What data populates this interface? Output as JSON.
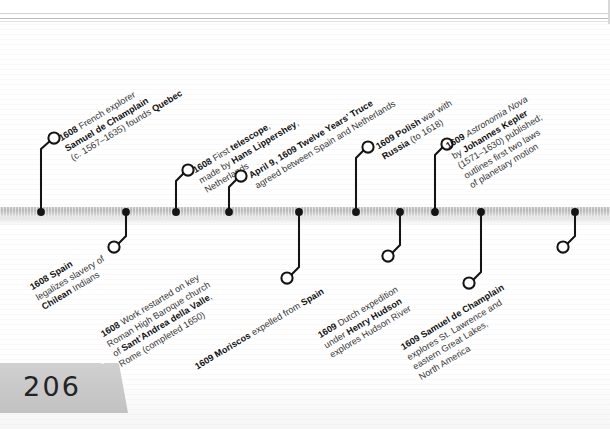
{
  "page": {
    "number": "206",
    "axis_color": "#b9b9b9",
    "ink_color": "#141414",
    "text_color": "#343434"
  },
  "timeline": {
    "orientation": "horizontal",
    "events_above": [
      {
        "id": "champlain-quebec",
        "marker_x": 41,
        "circle_x": 54,
        "circle_y": 138,
        "label_angle": -31,
        "label_x": 66,
        "label_y": 132,
        "lines": [
          "<b>1608</b> French explorer",
          "<b>Samuel de Champlain</b>",
          "(c. 1567–1635) founds <b>Quebec</b>"
        ]
      },
      {
        "id": "first-telescope",
        "marker_x": 176,
        "circle_x": 188,
        "circle_y": 170,
        "label_angle": -31,
        "label_x": 200,
        "label_y": 164,
        "lines": [
          "<b>1608</b> First <b>telescope</b>,",
          "made by <b>Hans Lippershey</b>,",
          "Netherlands"
        ]
      },
      {
        "id": "twelve-years-truce",
        "marker_x": 229,
        "circle_x": 241,
        "circle_y": 176,
        "label_angle": -31,
        "label_x": 253,
        "label_y": 170,
        "lines": [
          "<b>April 9, 1609 Twelve Years’ Truce</b>",
          "agreed between Spain and Netherlands"
        ]
      },
      {
        "id": "polish-russian-war",
        "marker_x": 356,
        "circle_x": 368,
        "circle_y": 147,
        "label_angle": -31,
        "label_x": 380,
        "label_y": 141,
        "lines": [
          "<b>1609 Polish</b> war with",
          "<b>Russia</b> (to 1618)"
        ]
      },
      {
        "id": "kepler-astronomia-nova",
        "marker_x": 435,
        "circle_x": 447,
        "circle_y": 144,
        "label_angle": -31,
        "label_x": 459,
        "label_y": 138,
        "lines": [
          "<b>1609</b> <i>Astronomia Nova</i>",
          "by <b>Johannes Kepler</b>",
          "(1571–1630) published;",
          "outlines first two laws",
          "of planetary motion"
        ]
      }
    ],
    "events_below": [
      {
        "id": "spain-slavery-chilean",
        "marker_x": 126,
        "circle_x": 114,
        "circle_y": 247,
        "label_angle": -31,
        "label_x": 37,
        "label_y": 281,
        "lines": [
          "<b>1608 Spain</b>",
          "legalizes slavery of",
          "<b>Chilean</b> Indians"
        ]
      },
      {
        "id": "santandrea-della-valle",
        "marker_x": 299,
        "circle_x": 287,
        "circle_y": 278,
        "label_angle": -31,
        "label_x": 111,
        "label_y": 327,
        "lines": [
          "<b>1608</b> Work restarted on key",
          "Roman High Baroque church",
          "of <b>Sant’Andrea della Valle</b>,",
          "Rome (completed 1650)"
        ]
      },
      {
        "id": "moriscos-expelled",
        "marker_x": 400,
        "circle_x": 388,
        "circle_y": 256,
        "label_angle": -31,
        "label_x": 196,
        "label_y": 362,
        "lines": [
          "<b>1609 Moriscos</b> expelled from <b>Spain</b>"
        ]
      },
      {
        "id": "henry-hudson",
        "marker_x": 481,
        "circle_x": 469,
        "circle_y": 283,
        "label_angle": -31,
        "label_x": 325,
        "label_y": 329,
        "lines": [
          "<b>1609</b> Dutch expedition",
          "under <b>Henry Hudson</b>",
          "explores Hudson River"
        ]
      },
      {
        "id": "champlain-great-lakes",
        "marker_x": 575,
        "circle_x": 563,
        "circle_y": 247,
        "label_angle": -31,
        "label_x": 411,
        "label_y": 340,
        "lines": [
          "<b>1609 Samuel de Champlain</b>",
          "explores St. Lawrence and",
          "eastern Great Lakes,",
          "North America"
        ]
      }
    ]
  }
}
